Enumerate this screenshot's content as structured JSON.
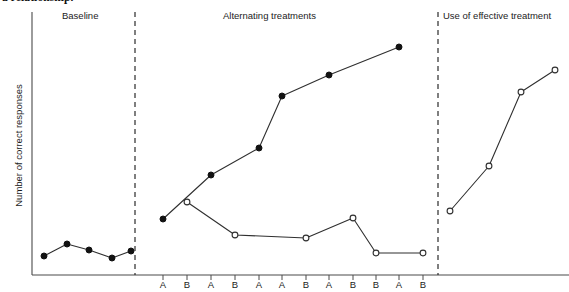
{
  "figure": {
    "caption": "a relationship.",
    "y_axis_label": "Number of correct responses"
  },
  "phases": [
    {
      "key": "baseline",
      "label": "Baseline",
      "left": 62
    },
    {
      "key": "alternating",
      "label": "Alternating treatments",
      "left": 223
    },
    {
      "key": "effective",
      "label": "Use of effective treatment",
      "left": 443
    }
  ],
  "dividers": [
    {
      "name": "phase-divider-1",
      "x": 135
    },
    {
      "name": "phase-divider-2",
      "x": 438
    }
  ],
  "axes": {
    "x_axis_y": 275,
    "y_axis_x": 32,
    "y_axis_top": 12,
    "x_axis_left": 32,
    "x_axis_right": 569,
    "x_tick_labels": [
      "A",
      "B",
      "A",
      "B",
      "A",
      "A",
      "B",
      "A",
      "B",
      "B",
      "A",
      "B"
    ],
    "x_tick_positions": [
      163,
      187,
      211,
      235,
      259,
      282,
      306,
      329,
      353,
      376,
      399,
      423
    ],
    "tick_length": 5
  },
  "chart_data": {
    "type": "line",
    "title": "",
    "xlabel": "",
    "ylabel": "Number of correct responses",
    "grid": false,
    "legend": "none",
    "note": "Single-case alternating treatments design. Filled markers = treatment A, open markers = treatment B. Y values are unlabeled ordinal positions read off the plot (higher = more correct responses); x positions are session indices.",
    "ylim": [
      0,
      292
    ],
    "series": [
      {
        "name": "baseline",
        "marker": "filled-circle",
        "points": [
          {
            "x": 44,
            "y": 256
          },
          {
            "x": 67,
            "y": 244
          },
          {
            "x": 89,
            "y": 250
          },
          {
            "x": 112,
            "y": 258
          },
          {
            "x": 131,
            "y": 251
          }
        ]
      },
      {
        "name": "alternating-treatment-A",
        "marker": "filled-circle",
        "points": [
          {
            "x": 163,
            "y": 219
          },
          {
            "x": 211,
            "y": 175
          },
          {
            "x": 259,
            "y": 148
          },
          {
            "x": 282,
            "y": 96
          },
          {
            "x": 329,
            "y": 75
          },
          {
            "x": 399,
            "y": 47
          }
        ]
      },
      {
        "name": "alternating-treatment-B",
        "marker": "open-circle",
        "points": [
          {
            "x": 187,
            "y": 202
          },
          {
            "x": 235,
            "y": 235
          },
          {
            "x": 306,
            "y": 238
          },
          {
            "x": 353,
            "y": 218
          },
          {
            "x": 376,
            "y": 253
          },
          {
            "x": 423,
            "y": 253
          }
        ]
      },
      {
        "name": "effective-treatment",
        "marker": "open-circle",
        "points": [
          {
            "x": 450,
            "y": 211
          },
          {
            "x": 489,
            "y": 166
          },
          {
            "x": 521,
            "y": 92
          },
          {
            "x": 555,
            "y": 70
          }
        ]
      }
    ]
  }
}
